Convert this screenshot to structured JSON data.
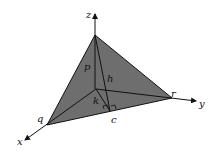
{
  "diagram": {
    "type": "3d-tetrahedron",
    "colors": {
      "face_fill": "#6e6e6e",
      "line": "#111111",
      "background": "#ffffff"
    },
    "axes": {
      "x": "x",
      "y": "y",
      "z": "z"
    },
    "points": {
      "q": "q",
      "r": "r",
      "c": "c"
    },
    "segments": {
      "p": "p",
      "h": "h",
      "k": "k"
    }
  }
}
